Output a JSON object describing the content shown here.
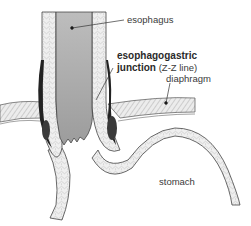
{
  "diagram": {
    "labels": {
      "esophagus": "esophagus",
      "ej_line1": "esophagogastric",
      "ej_line2_bold": "junction",
      "ej_line2_thin": "(Z-Z line)",
      "diaphragm": "diaphragm",
      "stomach": "stomach"
    },
    "colors": {
      "lumen": "#a9a9a9",
      "wall": "#e6e6e6",
      "outline": "#333333",
      "dark_fold": "#222222",
      "text": "#3a3a3a"
    }
  }
}
